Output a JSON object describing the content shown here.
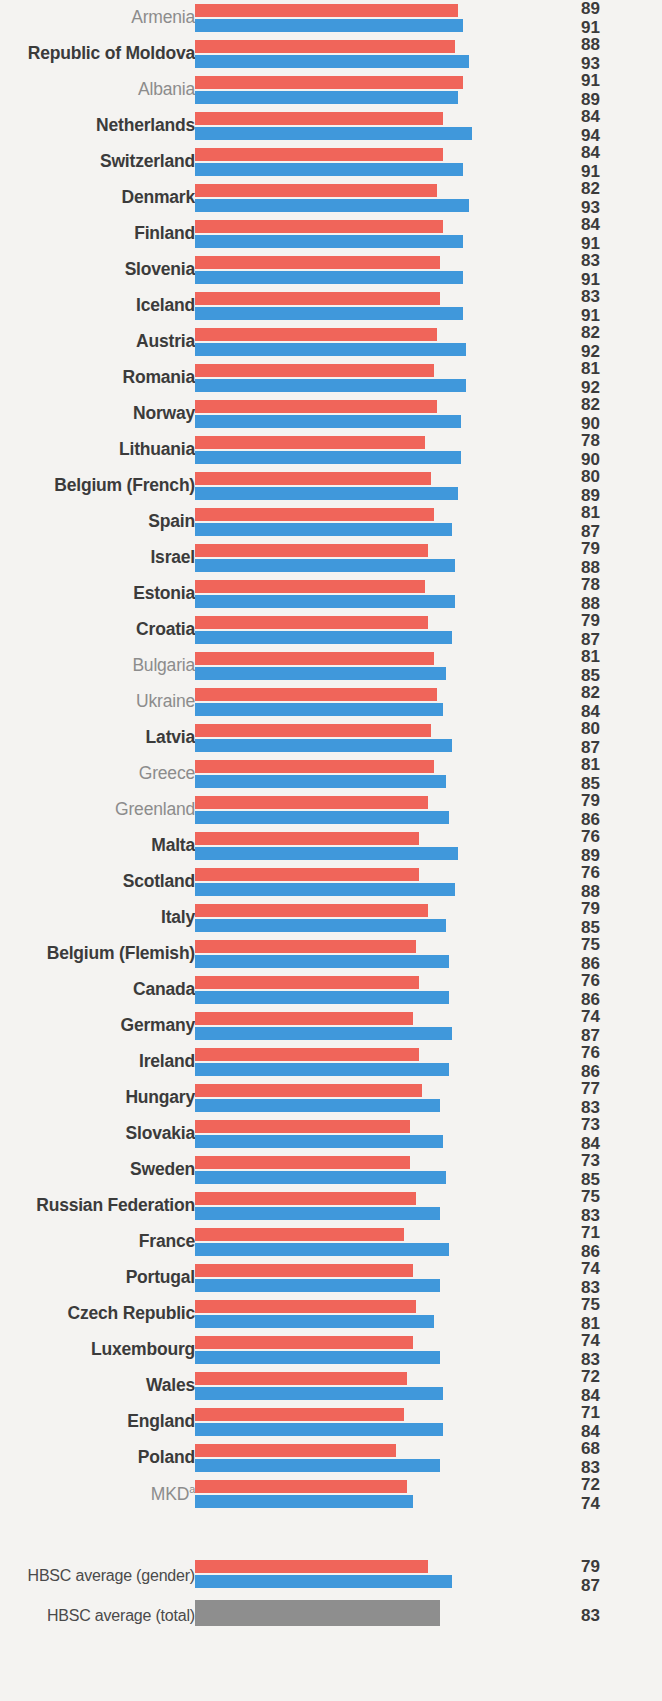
{
  "chart_data": {
    "type": "bar",
    "title": "",
    "xlabel": "",
    "ylabel": "",
    "orientation": "horizontal",
    "grid": false,
    "legend_position": "none",
    "xlim": [
      0,
      100
    ],
    "colors": {
      "girls": "#f0655a",
      "boys": "#4098db",
      "total": "#8e8e8e",
      "label_bold": "#3b3b3b",
      "label_plain": "#8c8c8c",
      "background": "#f4f3f1"
    },
    "series": [
      {
        "name": "girls",
        "color": "#f0655a"
      },
      {
        "name": "boys",
        "color": "#4098db"
      }
    ],
    "categories": [
      "Armenia",
      "Republic of Moldova",
      "Albania",
      "Netherlands",
      "Switzerland",
      "Denmark",
      "Finland",
      "Slovenia",
      "Iceland",
      "Austria",
      "Romania",
      "Norway",
      "Lithuania",
      "Belgium (French)",
      "Spain",
      "Israel",
      "Estonia",
      "Croatia",
      "Bulgaria",
      "Ukraine",
      "Latvia",
      "Greece",
      "Greenland",
      "Malta",
      "Scotland",
      "Italy",
      "Belgium (Flemish)",
      "Canada",
      "Germany",
      "Ireland",
      "Hungary",
      "Slovakia",
      "Sweden",
      "Russian Federation",
      "France",
      "Portugal",
      "Czech Republic",
      "Luxembourg",
      "Wales",
      "England",
      "Poland",
      "MKD"
    ],
    "girls_values": [
      89,
      88,
      91,
      84,
      84,
      82,
      84,
      83,
      83,
      82,
      81,
      82,
      78,
      80,
      81,
      79,
      78,
      79,
      81,
      82,
      80,
      81,
      79,
      76,
      76,
      79,
      75,
      76,
      74,
      76,
      77,
      73,
      73,
      75,
      71,
      74,
      75,
      74,
      72,
      71,
      68,
      72
    ],
    "boys_values": [
      91,
      93,
      89,
      94,
      91,
      93,
      91,
      91,
      91,
      92,
      92,
      90,
      90,
      89,
      87,
      88,
      88,
      87,
      85,
      84,
      87,
      85,
      86,
      89,
      88,
      85,
      86,
      86,
      87,
      86,
      83,
      84,
      85,
      83,
      86,
      83,
      81,
      83,
      84,
      84,
      83,
      74
    ],
    "averages": [
      {
        "label": "HBSC average (gender)",
        "girls": 79,
        "boys": 87
      },
      {
        "label": "HBSC average (total)",
        "total": 83
      }
    ]
  },
  "rows": [
    {
      "label": "Armenia",
      "style": "plain",
      "girls": 89,
      "boys": 91
    },
    {
      "label": "Republic of Moldova",
      "style": "bold",
      "girls": 88,
      "boys": 93
    },
    {
      "label": "Albania",
      "style": "plain",
      "girls": 91,
      "boys": 89
    },
    {
      "label": "Netherlands",
      "style": "bold",
      "girls": 84,
      "boys": 94
    },
    {
      "label": "Switzerland",
      "style": "bold",
      "girls": 84,
      "boys": 91
    },
    {
      "label": "Denmark",
      "style": "bold",
      "girls": 82,
      "boys": 93
    },
    {
      "label": "Finland",
      "style": "bold",
      "girls": 84,
      "boys": 91
    },
    {
      "label": "Slovenia",
      "style": "bold",
      "girls": 83,
      "boys": 91
    },
    {
      "label": "Iceland",
      "style": "bold",
      "girls": 83,
      "boys": 91
    },
    {
      "label": "Austria",
      "style": "bold",
      "girls": 82,
      "boys": 92
    },
    {
      "label": "Romania",
      "style": "bold",
      "girls": 81,
      "boys": 92
    },
    {
      "label": "Norway",
      "style": "bold",
      "girls": 82,
      "boys": 90
    },
    {
      "label": "Lithuania",
      "style": "bold",
      "girls": 78,
      "boys": 90
    },
    {
      "label": "Belgium (French)",
      "style": "bold",
      "girls": 80,
      "boys": 89
    },
    {
      "label": "Spain",
      "style": "bold",
      "girls": 81,
      "boys": 87
    },
    {
      "label": "Israel",
      "style": "bold",
      "girls": 79,
      "boys": 88
    },
    {
      "label": "Estonia",
      "style": "bold",
      "girls": 78,
      "boys": 88
    },
    {
      "label": "Croatia",
      "style": "bold",
      "girls": 79,
      "boys": 87
    },
    {
      "label": "Bulgaria",
      "style": "plain",
      "girls": 81,
      "boys": 85
    },
    {
      "label": "Ukraine",
      "style": "plain",
      "girls": 82,
      "boys": 84
    },
    {
      "label": "Latvia",
      "style": "bold",
      "girls": 80,
      "boys": 87
    },
    {
      "label": "Greece",
      "style": "plain",
      "girls": 81,
      "boys": 85
    },
    {
      "label": "Greenland",
      "style": "plain",
      "girls": 79,
      "boys": 86
    },
    {
      "label": "Malta",
      "style": "bold",
      "girls": 76,
      "boys": 89
    },
    {
      "label": "Scotland",
      "style": "bold",
      "girls": 76,
      "boys": 88
    },
    {
      "label": "Italy",
      "style": "bold",
      "girls": 79,
      "boys": 85
    },
    {
      "label": "Belgium (Flemish)",
      "style": "bold",
      "girls": 75,
      "boys": 86
    },
    {
      "label": "Canada",
      "style": "bold",
      "girls": 76,
      "boys": 86
    },
    {
      "label": "Germany",
      "style": "bold",
      "girls": 74,
      "boys": 87
    },
    {
      "label": "Ireland",
      "style": "bold",
      "girls": 76,
      "boys": 86
    },
    {
      "label": "Hungary",
      "style": "bold",
      "girls": 77,
      "boys": 83
    },
    {
      "label": "Slovakia",
      "style": "bold",
      "girls": 73,
      "boys": 84
    },
    {
      "label": "Sweden",
      "style": "bold",
      "girls": 73,
      "boys": 85
    },
    {
      "label": "Russian Federation",
      "style": "bold",
      "girls": 75,
      "boys": 83
    },
    {
      "label": "France",
      "style": "bold",
      "girls": 71,
      "boys": 86
    },
    {
      "label": "Portugal",
      "style": "bold",
      "girls": 74,
      "boys": 83
    },
    {
      "label": "Czech Republic",
      "style": "bold",
      "girls": 75,
      "boys": 81
    },
    {
      "label": "Luxembourg",
      "style": "bold",
      "girls": 74,
      "boys": 83
    },
    {
      "label": "Wales",
      "style": "bold",
      "girls": 72,
      "boys": 84
    },
    {
      "label": "England",
      "style": "bold",
      "girls": 71,
      "boys": 84
    },
    {
      "label": "Poland",
      "style": "bold",
      "girls": 68,
      "boys": 83
    },
    {
      "label": "MKD",
      "style": "plain",
      "superscript": "a",
      "girls": 72,
      "boys": 74
    }
  ],
  "average_rows": [
    {
      "label": "HBSC average (gender)",
      "girls": 79,
      "boys": 87
    },
    {
      "label": "HBSC average (total)",
      "total": 83
    }
  ]
}
